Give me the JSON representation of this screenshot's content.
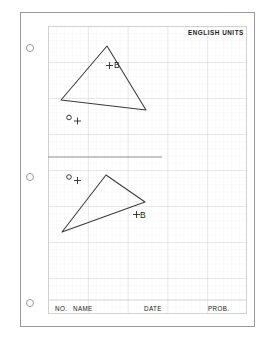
{
  "document": {
    "kind": "engineering-graph-paper-worksheet",
    "header_right_label": "ENGLISH UNITS",
    "footer_fields": [
      {
        "label": "NO."
      },
      {
        "label": "NAME"
      },
      {
        "label": "DATE"
      },
      {
        "label": "PROB."
      }
    ],
    "punch_holes": [
      {
        "cy": 48
      },
      {
        "cy": 177
      },
      {
        "cy": 303
      }
    ],
    "grid": {
      "major_color": "#d0d0d0",
      "minor_color": "#ededed",
      "major_cols": 5,
      "major_rows": 8,
      "minor_per_major": 5
    },
    "separator": {
      "label": "section-divider-line",
      "color": "#8f8f8f"
    }
  },
  "figures": {
    "upper": {
      "name": "upper-triangle",
      "vertices": "107,46 61,100 146,110",
      "stroke": "#3a3a3a",
      "point_b_label": "B",
      "point_o_label": "O"
    },
    "lower": {
      "name": "lower-triangle",
      "vertices": "106,175 145,202 62,232",
      "stroke": "#3a3a3a",
      "point_b_label": "B",
      "point_o_label": "O"
    }
  },
  "ink": {
    "line_color": "#3a3a3a",
    "text_color": "#1a1a1a",
    "border_color": "#9a9a9a"
  }
}
